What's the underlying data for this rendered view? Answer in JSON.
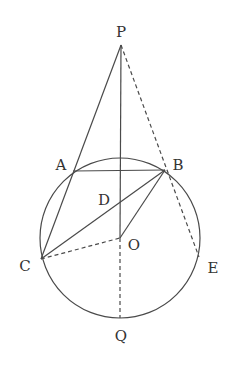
{
  "diagram": {
    "type": "geometry",
    "circle": {
      "center": "O",
      "label": "O"
    },
    "points": {
      "P": {
        "label": "P"
      },
      "A": {
        "label": "A"
      },
      "B": {
        "label": "B"
      },
      "C": {
        "label": "C"
      },
      "D": {
        "label": "D"
      },
      "O": {
        "label": "O"
      },
      "E": {
        "label": "E"
      },
      "Q": {
        "label": "Q"
      }
    },
    "segments_solid": [
      "PA-C",
      "PO",
      "AB",
      "BC",
      "BO"
    ],
    "segments_dashed": [
      "PB-E",
      "CO",
      "OQ"
    ],
    "colors": {
      "stroke": "#4a4a4a",
      "text": "#333333",
      "background": "#ffffff"
    }
  }
}
